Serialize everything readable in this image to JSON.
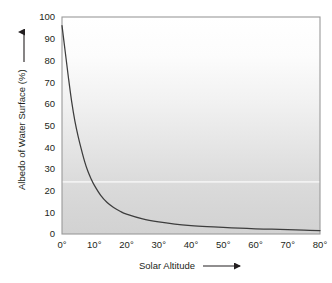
{
  "chart_data": {
    "type": "line",
    "title": "",
    "xlabel": "Solar Altitude",
    "ylabel": "Albedo of Water Surface (%)",
    "xlim": [
      0,
      80
    ],
    "ylim": [
      0,
      100
    ],
    "grid": false,
    "legend": "none",
    "x_tick_labels": [
      "0°",
      "10°",
      "20°",
      "30°",
      "40°",
      "50°",
      "60°",
      "70°",
      "80°"
    ],
    "x_tick_values": [
      0,
      10,
      20,
      30,
      40,
      50,
      60,
      70,
      80
    ],
    "y_tick_labels": [
      "0",
      "10",
      "20",
      "30",
      "40",
      "50",
      "60",
      "70",
      "80",
      "90",
      "100"
    ],
    "y_tick_values": [
      0,
      10,
      20,
      30,
      40,
      50,
      60,
      70,
      80,
      90,
      100
    ],
    "x_axis_arrow": "→",
    "y_axis_arrow": "↑",
    "series": [
      {
        "name": "Albedo of water surface",
        "x": [
          0,
          1,
          2,
          3,
          4,
          5,
          6,
          7,
          8,
          9,
          10,
          12,
          14,
          16,
          18,
          20,
          25,
          30,
          35,
          40,
          45,
          50,
          55,
          60,
          65,
          70,
          75,
          80
        ],
        "values": [
          96,
          84,
          72,
          61,
          52,
          45,
          39,
          33.5,
          29,
          25.5,
          22.5,
          17.8,
          14.5,
          12.2,
          10.5,
          9.2,
          7.0,
          5.6,
          4.6,
          3.9,
          3.4,
          3.0,
          2.7,
          2.4,
          2.2,
          2.0,
          1.8,
          1.6
        ]
      }
    ],
    "colors": {
      "curve": "#3d3d3d",
      "plot_border": "#9a9a9a",
      "axis": "#8a8a8a",
      "text": "#231f20",
      "background_top": "#ffffff",
      "background_bottom": "#d2d2d2",
      "band_highlight": "#f2f2f2",
      "page_background": "#ffffff"
    },
    "background_band_value": 24
  }
}
